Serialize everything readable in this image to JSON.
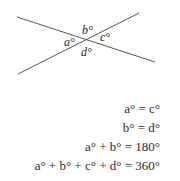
{
  "diagram": {
    "lines": [
      {
        "x1": 17,
        "y1": 17,
        "x2": 155,
        "y2": 62
      },
      {
        "x1": 18,
        "y1": 74,
        "x2": 139,
        "y2": 13
      }
    ],
    "line_color": "#555555",
    "angle_labels": {
      "a": "a°",
      "b": "b°",
      "c": "c°",
      "d": "d°"
    }
  },
  "equations": [
    "a° = c°",
    "b° = d°",
    "a° + b° = 180°",
    "a° + b° + c° + d° = 360°"
  ]
}
